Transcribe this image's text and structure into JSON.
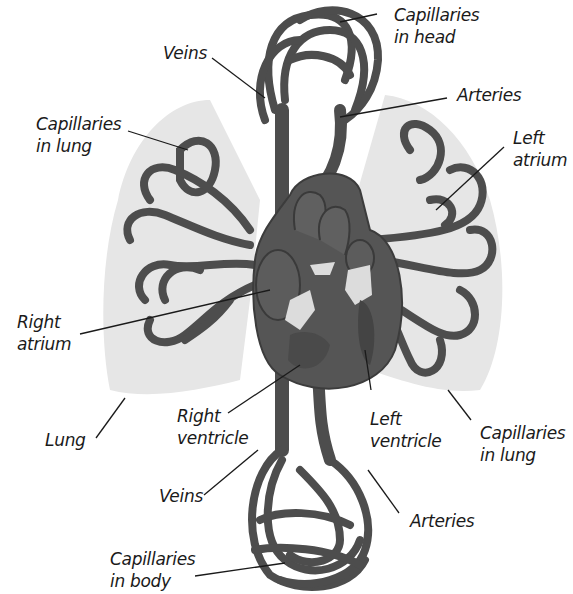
{
  "diagram": {
    "colors": {
      "vessel": "#4a4a4a",
      "vessel_light": "#6e6e6e",
      "lung": "#e6e6e6",
      "valve": "#d9d9d9",
      "leader": "#1a1a1a",
      "text": "#1a1a1a"
    },
    "labels": [
      {
        "id": "capillaries-head",
        "line1": "Capillaries",
        "line2": "in head"
      },
      {
        "id": "veins-top",
        "line1": "Veins",
        "line2": ""
      },
      {
        "id": "arteries-top",
        "line1": "Arteries",
        "line2": ""
      },
      {
        "id": "capillaries-lung-left",
        "line1": "Capillaries",
        "line2": "in lung"
      },
      {
        "id": "left-atrium",
        "line1": "Left",
        "line2": "atrium"
      },
      {
        "id": "right-atrium",
        "line1": "Right",
        "line2": "atrium"
      },
      {
        "id": "lung",
        "line1": "Lung",
        "line2": ""
      },
      {
        "id": "right-ventricle",
        "line1": "Right",
        "line2": "ventricle"
      },
      {
        "id": "left-ventricle",
        "line1": "Left",
        "line2": "ventricle"
      },
      {
        "id": "capillaries-lung-right",
        "line1": "Capillaries",
        "line2": "in lung"
      },
      {
        "id": "veins-bottom",
        "line1": "Veins",
        "line2": ""
      },
      {
        "id": "arteries-bottom",
        "line1": "Arteries",
        "line2": ""
      },
      {
        "id": "capillaries-body",
        "line1": "Capillaries",
        "line2": "in body"
      }
    ]
  }
}
